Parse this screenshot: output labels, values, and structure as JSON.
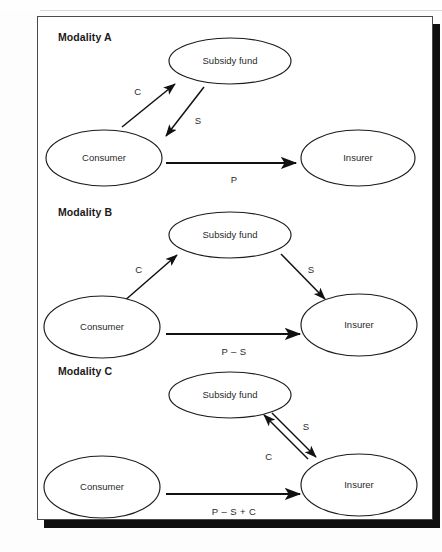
{
  "figure": {
    "top_cut_text": "·· ·····",
    "frame_border_color": "#4a4a4a",
    "shadow_color": "#101010",
    "ink_color": "#1b1b1b"
  },
  "chart_data": {
    "type": "diagram",
    "title": "",
    "subgraphs": [
      {
        "label": "Modality A",
        "label_x": 20,
        "label_y": 24,
        "nodes": [
          {
            "id": "a-subsidy",
            "label": "Subsidy fund",
            "cx": 192,
            "cy": 44,
            "rx": 61,
            "ry": 23
          },
          {
            "id": "a-consumer",
            "label": "Consumer",
            "cx": 66,
            "cy": 141,
            "rx": 58,
            "ry": 28
          },
          {
            "id": "a-insurer",
            "label": "Insurer",
            "cx": 320,
            "cy": 141,
            "rx": 57,
            "ry": 28
          }
        ],
        "edges": [
          {
            "id": "a-c",
            "label": "C",
            "x1": 84,
            "y1": 110,
            "x2": 137,
            "y2": 67,
            "lx": 100,
            "ly": 75,
            "arrow": "end"
          },
          {
            "id": "a-s",
            "label": "S",
            "x1": 166,
            "y1": 70,
            "x2": 128,
            "y2": 119,
            "lx": 160,
            "ly": 104,
            "arrow": "end"
          },
          {
            "id": "a-p",
            "label": "P",
            "x1": 128,
            "y1": 146,
            "x2": 258,
            "y2": 146,
            "lx": 196,
            "ly": 163,
            "arrow": "end"
          }
        ]
      },
      {
        "label": "Modality B",
        "label_x": 20,
        "label_y": 199,
        "nodes": [
          {
            "id": "b-subsidy",
            "label": "Subsidy fund",
            "cx": 192,
            "cy": 218,
            "rx": 61,
            "ry": 23
          },
          {
            "id": "b-consumer",
            "label": "Consumer",
            "cx": 64,
            "cy": 310,
            "rx": 58,
            "ry": 31
          },
          {
            "id": "b-insurer",
            "label": "Insurer",
            "cx": 321,
            "cy": 308,
            "rx": 58,
            "ry": 31
          }
        ],
        "edges": [
          {
            "id": "b-c",
            "label": "C",
            "x1": 85,
            "y1": 285,
            "x2": 139,
            "y2": 238,
            "lx": 101,
            "ly": 253,
            "arrow": "end"
          },
          {
            "id": "b-s",
            "label": "S",
            "x1": 243,
            "y1": 237,
            "x2": 287,
            "y2": 282,
            "lx": 273,
            "ly": 253,
            "arrow": "end"
          },
          {
            "id": "b-ps",
            "label": "P – S",
            "x1": 128,
            "y1": 317,
            "x2": 262,
            "y2": 317,
            "lx": 196,
            "ly": 335,
            "arrow": "end"
          }
        ]
      },
      {
        "label": "Modality C",
        "label_x": 20,
        "label_y": 358,
        "nodes": [
          {
            "id": "c-subsidy",
            "label": "Subsidy fund",
            "cx": 192,
            "cy": 378,
            "rx": 61,
            "ry": 23
          },
          {
            "id": "c-consumer",
            "label": "Consumer",
            "cx": 64,
            "cy": 470,
            "rx": 58,
            "ry": 31
          },
          {
            "id": "c-insurer",
            "label": "Insurer",
            "cx": 321,
            "cy": 468,
            "rx": 58,
            "ry": 31
          }
        ],
        "edges": [
          {
            "id": "c-s",
            "label": "S",
            "x1": 234,
            "y1": 396,
            "x2": 278,
            "y2": 440,
            "lx": 268,
            "ly": 410,
            "arrow": "end"
          },
          {
            "id": "c-c",
            "label": "C",
            "x1": 270,
            "y1": 442,
            "x2": 226,
            "y2": 398,
            "lx": 231,
            "ly": 440,
            "arrow": "end"
          },
          {
            "id": "c-psc",
            "label": "P – S + C",
            "x1": 128,
            "y1": 477,
            "x2": 262,
            "y2": 477,
            "lx": 196,
            "ly": 495,
            "arrow": "end"
          }
        ]
      }
    ]
  }
}
